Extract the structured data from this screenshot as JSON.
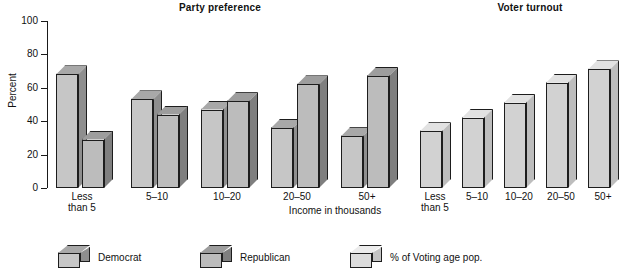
{
  "chart_data": {
    "type": "bar",
    "title": "",
    "xlabel": "Income in thousands",
    "ylabel": "Percent",
    "ylim": [
      0,
      100
    ],
    "yticks": [
      0,
      20,
      40,
      60,
      80,
      100
    ],
    "grid": false,
    "legend_position": "bottom",
    "panels": [
      {
        "title": "Party preference",
        "categories": [
          "Less\nthan 5",
          "5–10",
          "10–20",
          "20–50",
          "50+"
        ],
        "series": [
          {
            "name": "Democrat",
            "values": [
              68,
              53,
              47,
              36,
              31
            ]
          },
          {
            "name": "Republican",
            "values": [
              29,
              44,
              52,
              62,
              67
            ]
          }
        ]
      },
      {
        "title": "Voter turnout",
        "categories": [
          "Less\nthan 5",
          "5–10",
          "10–20",
          "20–50",
          "50+"
        ],
        "series": [
          {
            "name": "% of Voting age pop.",
            "values": [
              34,
              42,
              51,
              63,
              71
            ]
          }
        ]
      }
    ],
    "legend": [
      {
        "label": "Democrat",
        "swatch": "mid"
      },
      {
        "label": "Republican",
        "swatch": "dark"
      },
      {
        "label": "% of Voting age pop.",
        "swatch": "light"
      }
    ]
  },
  "axis": {
    "y_title": "Percent",
    "x_title": "Income in thousands",
    "y_tick_labels": [
      "100",
      "80",
      "60",
      "40",
      "20",
      "0"
    ]
  },
  "panel_titles": {
    "party": "Party preference",
    "turnout": "Voter turnout"
  },
  "colors": {
    "bar_face": "#c6c6c6",
    "bar_side": "#8e8e8e",
    "bar_top": "#a8a8a8",
    "outline": "#1d1d1d",
    "background": "#ffffff",
    "text": "#111111"
  }
}
